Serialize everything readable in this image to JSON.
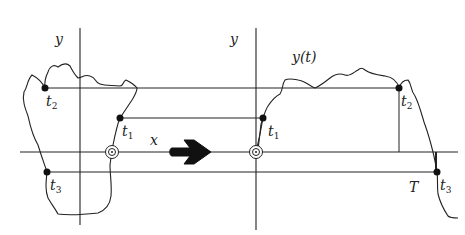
{
  "diagram": {
    "left_axis_label": "y",
    "right_axis_label": "y",
    "curve_label": "y(t)",
    "x_label": "x",
    "period_label": "T",
    "points_left": [
      {
        "name": "t",
        "sub": "2"
      },
      {
        "name": "t",
        "sub": "1"
      },
      {
        "name": "t",
        "sub": "3"
      }
    ],
    "points_right": [
      {
        "name": "t",
        "sub": "1"
      },
      {
        "name": "t",
        "sub": "2"
      },
      {
        "name": "t",
        "sub": "3"
      }
    ],
    "colors": {
      "stroke": "#222222",
      "background": "#ffffff"
    }
  }
}
